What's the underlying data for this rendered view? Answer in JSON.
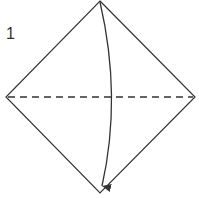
{
  "diagram": {
    "step_number": "1",
    "colors": {
      "line": "#333333",
      "background": "#ffffff"
    },
    "shape": {
      "type": "square-on-point (diamond)",
      "vertices": {
        "top": [
          100,
          1
        ],
        "right": [
          195,
          97
        ],
        "bottom": [
          100,
          193
        ],
        "left": [
          6,
          97
        ]
      }
    },
    "fold_line": {
      "type": "valley fold (dashed)",
      "from": [
        6,
        97
      ],
      "to": [
        195,
        97
      ]
    },
    "arrow": {
      "meaning": "fold top corner down to bottom corner",
      "from": [
        100,
        2
      ],
      "to": [
        102,
        190
      ]
    }
  }
}
